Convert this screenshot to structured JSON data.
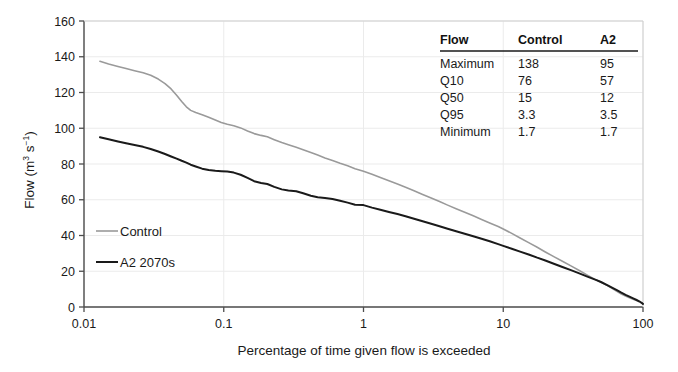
{
  "chart_data": {
    "type": "line",
    "title": "",
    "xlabel": "Percentage of time given flow is exceeded",
    "ylabel": "Flow (m3 s-1)",
    "ylabel_parts": {
      "prefix": "Flow (m",
      "sup1": "3",
      "mid": " s",
      "sup2": "−1",
      "suffix": ")"
    },
    "xscale": "log",
    "yscale": "linear",
    "xlim": [
      0.01,
      100
    ],
    "ylim": [
      0,
      160
    ],
    "xticks": [
      0.01,
      0.1,
      1,
      10,
      100
    ],
    "xtick_labels": [
      "0.01",
      "0.1",
      "1",
      "10",
      "100"
    ],
    "yticks": [
      0,
      20,
      40,
      60,
      80,
      100,
      120,
      140,
      160
    ],
    "ytick_labels": [
      "0",
      "20",
      "40",
      "60",
      "80",
      "100",
      "120",
      "140",
      "160"
    ],
    "grid": true,
    "legend_position": "lower-left-inside",
    "series": [
      {
        "name": "Control",
        "color": "#9a9a9a",
        "width": 1.6,
        "points": [
          [
            0.013,
            137.5
          ],
          [
            0.015,
            136.0
          ],
          [
            0.0175,
            134.6
          ],
          [
            0.02,
            133.4
          ],
          [
            0.023,
            132.2
          ],
          [
            0.0265,
            131.0
          ],
          [
            0.03,
            129.6
          ],
          [
            0.034,
            127.5
          ],
          [
            0.038,
            125.0
          ],
          [
            0.042,
            122.0
          ],
          [
            0.046,
            118.5
          ],
          [
            0.05,
            115.0
          ],
          [
            0.054,
            112.0
          ],
          [
            0.058,
            110.0
          ],
          [
            0.063,
            108.8
          ],
          [
            0.07,
            107.6
          ],
          [
            0.078,
            106.2
          ],
          [
            0.087,
            104.6
          ],
          [
            0.096,
            103.2
          ],
          [
            0.106,
            102.2
          ],
          [
            0.118,
            101.4
          ],
          [
            0.132,
            100.2
          ],
          [
            0.148,
            98.5
          ],
          [
            0.165,
            97.0
          ],
          [
            0.185,
            96.0
          ],
          [
            0.205,
            95.2
          ],
          [
            0.23,
            93.6
          ],
          [
            0.26,
            92.0
          ],
          [
            0.29,
            90.8
          ],
          [
            0.33,
            89.4
          ],
          [
            0.37,
            88.0
          ],
          [
            0.42,
            86.4
          ],
          [
            0.47,
            85.0
          ],
          [
            0.53,
            83.4
          ],
          [
            0.6,
            82.0
          ],
          [
            0.68,
            80.4
          ],
          [
            0.77,
            79.0
          ],
          [
            0.87,
            77.4
          ],
          [
            1.0,
            76.0
          ],
          [
            1.15,
            74.2
          ],
          [
            1.32,
            72.4
          ],
          [
            1.52,
            70.6
          ],
          [
            1.75,
            68.8
          ],
          [
            2.0,
            67.0
          ],
          [
            2.3,
            65.0
          ],
          [
            2.65,
            63.0
          ],
          [
            3.05,
            61.0
          ],
          [
            3.5,
            59.0
          ],
          [
            4.0,
            57.0
          ],
          [
            4.6,
            55.0
          ],
          [
            5.3,
            53.0
          ],
          [
            6.1,
            51.0
          ],
          [
            7.0,
            49.0
          ],
          [
            8.0,
            47.0
          ],
          [
            9.2,
            45.0
          ],
          [
            10.0,
            43.6
          ],
          [
            11.5,
            41.2
          ],
          [
            13.2,
            38.6
          ],
          [
            15.2,
            36.0
          ],
          [
            17.5,
            33.4
          ],
          [
            20.0,
            30.8
          ],
          [
            23.0,
            28.2
          ],
          [
            26.5,
            25.6
          ],
          [
            30.5,
            23.0
          ],
          [
            35.0,
            20.4
          ],
          [
            40.0,
            17.8
          ],
          [
            46.0,
            15.2
          ],
          [
            50.0,
            14.0
          ],
          [
            55.0,
            12.2
          ],
          [
            60.0,
            10.4
          ],
          [
            65.0,
            8.8
          ],
          [
            70.0,
            7.3
          ],
          [
            75.0,
            6.2
          ],
          [
            80.0,
            5.2
          ],
          [
            85.0,
            4.4
          ],
          [
            90.0,
            3.6
          ],
          [
            94.0,
            3.0
          ],
          [
            97.0,
            2.4
          ],
          [
            99.0,
            2.0
          ],
          [
            100.0,
            1.7
          ]
        ]
      },
      {
        "name": "A2 2070s",
        "color": "#1a1a1a",
        "width": 2.0,
        "points": [
          [
            0.013,
            95.0
          ],
          [
            0.015,
            93.8
          ],
          [
            0.0175,
            92.6
          ],
          [
            0.02,
            91.6
          ],
          [
            0.023,
            90.6
          ],
          [
            0.0265,
            89.6
          ],
          [
            0.03,
            88.4
          ],
          [
            0.034,
            87.0
          ],
          [
            0.038,
            85.6
          ],
          [
            0.042,
            84.2
          ],
          [
            0.046,
            83.0
          ],
          [
            0.05,
            81.8
          ],
          [
            0.054,
            80.8
          ],
          [
            0.058,
            79.6
          ],
          [
            0.063,
            78.6
          ],
          [
            0.07,
            77.4
          ],
          [
            0.078,
            76.6
          ],
          [
            0.087,
            76.2
          ],
          [
            0.096,
            76.0
          ],
          [
            0.106,
            75.8
          ],
          [
            0.118,
            75.2
          ],
          [
            0.132,
            74.0
          ],
          [
            0.148,
            72.2
          ],
          [
            0.165,
            70.4
          ],
          [
            0.185,
            69.4
          ],
          [
            0.205,
            68.8
          ],
          [
            0.23,
            67.2
          ],
          [
            0.26,
            65.8
          ],
          [
            0.29,
            65.2
          ],
          [
            0.33,
            64.8
          ],
          [
            0.37,
            63.6
          ],
          [
            0.42,
            62.2
          ],
          [
            0.47,
            61.4
          ],
          [
            0.53,
            61.0
          ],
          [
            0.6,
            60.4
          ],
          [
            0.68,
            59.4
          ],
          [
            0.77,
            58.4
          ],
          [
            0.87,
            57.2
          ],
          [
            1.0,
            57.0
          ],
          [
            1.15,
            55.6
          ],
          [
            1.32,
            54.4
          ],
          [
            1.52,
            53.2
          ],
          [
            1.75,
            52.0
          ],
          [
            2.0,
            50.8
          ],
          [
            2.3,
            49.4
          ],
          [
            2.65,
            48.0
          ],
          [
            3.05,
            46.6
          ],
          [
            3.5,
            45.2
          ],
          [
            4.0,
            43.8
          ],
          [
            4.6,
            42.4
          ],
          [
            5.3,
            41.0
          ],
          [
            6.1,
            39.6
          ],
          [
            7.0,
            38.2
          ],
          [
            8.0,
            36.8
          ],
          [
            9.2,
            35.2
          ],
          [
            10.0,
            34.2
          ],
          [
            11.5,
            32.6
          ],
          [
            13.2,
            31.0
          ],
          [
            15.2,
            29.4
          ],
          [
            17.5,
            27.6
          ],
          [
            20.0,
            26.0
          ],
          [
            23.0,
            24.2
          ],
          [
            26.5,
            22.4
          ],
          [
            30.5,
            20.6
          ],
          [
            35.0,
            18.8
          ],
          [
            40.0,
            17.0
          ],
          [
            46.0,
            15.2
          ],
          [
            50.0,
            14.0
          ],
          [
            55.0,
            12.4
          ],
          [
            60.0,
            10.8
          ],
          [
            65.0,
            9.4
          ],
          [
            70.0,
            8.0
          ],
          [
            75.0,
            6.8
          ],
          [
            80.0,
            5.8
          ],
          [
            85.0,
            4.8
          ],
          [
            90.0,
            3.9
          ],
          [
            94.0,
            3.2
          ],
          [
            97.0,
            2.5
          ],
          [
            99.0,
            2.0
          ],
          [
            100.0,
            1.7
          ]
        ]
      }
    ],
    "table": {
      "columns": [
        "Flow",
        "Control",
        "A2"
      ],
      "rows": [
        {
          "label": "Maximum",
          "control": "138",
          "a2": "95"
        },
        {
          "label": "Q10",
          "control": "76",
          "a2": "57"
        },
        {
          "label": "Q50",
          "control": "15",
          "a2": "12"
        },
        {
          "label": "Q95",
          "control": "3.3",
          "a2": "3.5"
        },
        {
          "label": "Minimum",
          "control": "1.7",
          "a2": "1.7"
        }
      ]
    },
    "colors": {
      "control": "#9a9a9a",
      "a2": "#1a1a1a",
      "grid": "#ebebeb",
      "axis": "#4d4d4d",
      "background": "#ffffff"
    }
  }
}
